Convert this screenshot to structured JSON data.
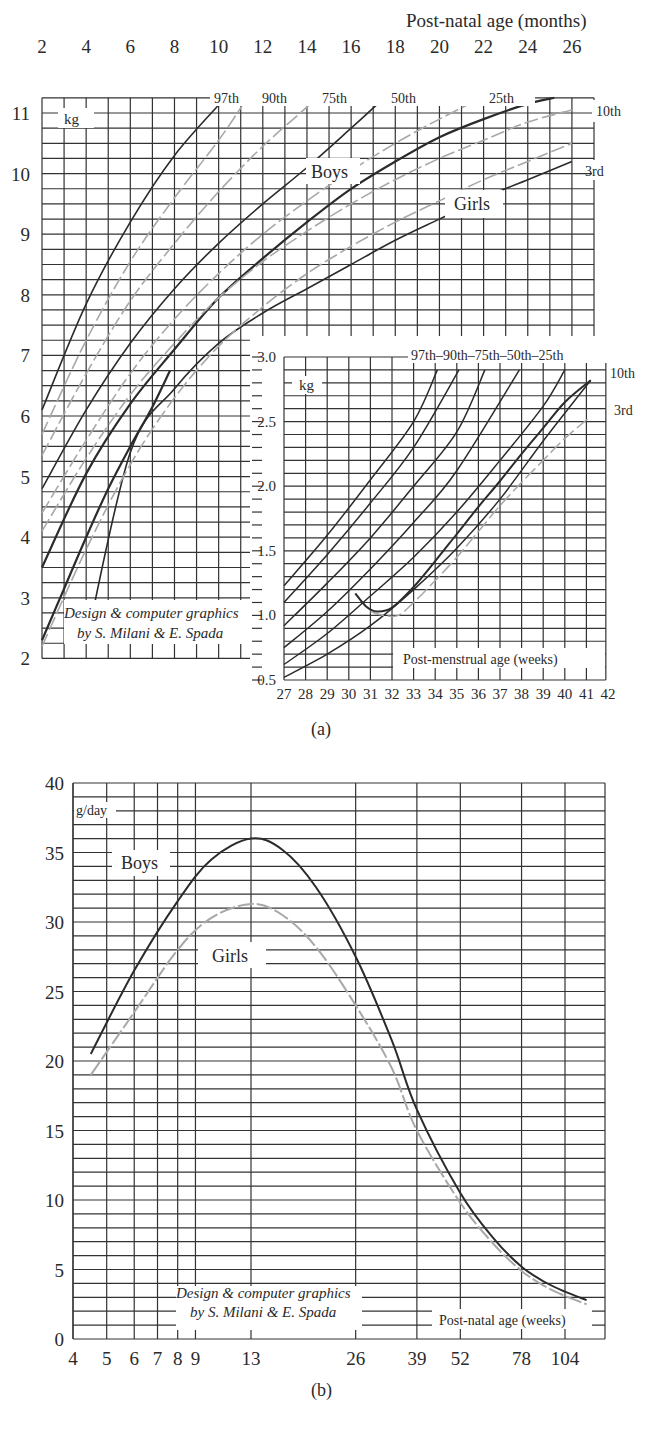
{
  "figure": {
    "panel_a_label": "(a)",
    "panel_b_label": "(b)"
  },
  "chart_data": [
    {
      "id": "a-main",
      "type": "line",
      "title": "",
      "xlabel": "Post-natal age (months)",
      "ylabel": "kg",
      "x_ticks": [
        2,
        4,
        6,
        8,
        10,
        12,
        14,
        16,
        18,
        20,
        22,
        24,
        26
      ],
      "y_ticks": [
        2,
        3,
        4,
        5,
        6,
        7,
        8,
        9,
        10,
        11
      ],
      "xlim": [
        2,
        27
      ],
      "ylim": [
        2,
        11.25
      ],
      "group_labels": [
        "Boys",
        "Girls"
      ],
      "legend_note": "Boys: solid dark lines; Girls: dashed grey lines",
      "series": [
        {
          "name": "Boys 97th",
          "group": "Boys",
          "x": [
            2,
            4,
            6,
            8,
            10.3
          ],
          "values": [
            6.1,
            7.85,
            9.2,
            10.3,
            11.25
          ]
        },
        {
          "name": "Boys 50th",
          "group": "Boys",
          "x": [
            2,
            4,
            6,
            8,
            10,
            12,
            14,
            16,
            17.5
          ],
          "values": [
            4.8,
            6.1,
            7.2,
            8.1,
            8.85,
            9.5,
            10.1,
            10.75,
            11.25
          ]
        },
        {
          "name": "Boys 10th",
          "group": "Boys",
          "x": [
            2,
            4,
            6,
            8,
            10,
            12,
            14,
            16,
            18,
            20,
            22,
            24,
            25.2
          ],
          "values": [
            3.5,
            5.05,
            6.2,
            7.1,
            7.95,
            8.6,
            9.2,
            9.75,
            10.2,
            10.6,
            10.9,
            11.15,
            11.25
          ]
        },
        {
          "name": "Boys 3rd",
          "group": "Boys",
          "x": [
            4,
            6,
            8,
            10,
            12,
            14,
            16,
            18,
            20,
            22,
            24,
            26
          ],
          "values": [
            2.25,
            5.4,
            6.45,
            7.2,
            7.7,
            8.1,
            8.5,
            8.9,
            9.25,
            9.6,
            9.9,
            10.2
          ]
        },
        {
          "name": "Boys 3rd (early)",
          "group": "Boys",
          "x": [
            2,
            3,
            4,
            5,
            6,
            7,
            7.8
          ],
          "values": [
            2.3,
            3.15,
            4.0,
            4.8,
            5.5,
            6.15,
            6.75
          ]
        },
        {
          "name": "Girls 90th",
          "group": "Girls",
          "x": [
            2,
            4,
            6,
            8,
            10,
            11.3
          ],
          "values": [
            5.7,
            7.25,
            8.55,
            9.6,
            10.55,
            11.25
          ]
        },
        {
          "name": "Girls 75th",
          "group": "Girls",
          "x": [
            2,
            4,
            6,
            8,
            10,
            12,
            14,
            14.3
          ],
          "values": [
            5.35,
            6.7,
            7.9,
            8.85,
            9.7,
            10.45,
            11.1,
            11.25
          ]
        },
        {
          "name": "Girls 25th",
          "group": "Girls",
          "x": [
            2,
            4,
            6,
            8,
            10,
            12,
            14,
            16,
            18,
            20,
            21.9
          ],
          "values": [
            4.4,
            5.6,
            6.7,
            7.6,
            8.35,
            9.0,
            9.55,
            10.05,
            10.5,
            10.9,
            11.25
          ]
        },
        {
          "name": "Girls 10th",
          "group": "Girls",
          "x": [
            2,
            4,
            6,
            8,
            10,
            12,
            14,
            16,
            18,
            20,
            22,
            24,
            26
          ],
          "values": [
            4.1,
            5.3,
            6.35,
            7.2,
            7.95,
            8.55,
            9.05,
            9.5,
            9.9,
            10.25,
            10.55,
            10.85,
            11.05
          ]
        },
        {
          "name": "Girls 3rd",
          "group": "Girls",
          "x": [
            2,
            4,
            6,
            8,
            10,
            12,
            14,
            16,
            18,
            20,
            22,
            24,
            26
          ],
          "values": [
            2.2,
            3.8,
            5.2,
            6.3,
            7.15,
            7.8,
            8.35,
            8.8,
            9.2,
            9.55,
            9.9,
            10.2,
            10.5
          ]
        }
      ],
      "percentile_labels": [
        "97th",
        "90th",
        "75th",
        "50th",
        "25th",
        "10th",
        "3rd"
      ],
      "annotations": [
        "Design & computer graphics",
        "by S. Milani & E. Spada"
      ]
    },
    {
      "id": "a-inset",
      "type": "line",
      "title": "",
      "xlabel": "Post-menstrual age (weeks)",
      "ylabel": "kg",
      "x_ticks": [
        27,
        28,
        29,
        30,
        31,
        32,
        33,
        34,
        35,
        36,
        37,
        38,
        39,
        40,
        41,
        42
      ],
      "y_ticks": [
        0.5,
        1.0,
        1.5,
        2.0,
        2.5,
        3.0
      ],
      "xlim": [
        27,
        42
      ],
      "ylim": [
        0.5,
        3.0
      ],
      "percentile_labels": [
        "97th",
        "90th",
        "75th",
        "50th",
        "25th",
        "10th",
        "3rd"
      ],
      "series": [
        {
          "name": "97th",
          "x": [
            27,
            29,
            31,
            33,
            34.1
          ],
          "values": [
            1.23,
            1.62,
            2.05,
            2.5,
            2.9
          ]
        },
        {
          "name": "90th",
          "x": [
            27,
            29,
            31,
            33,
            35.1
          ],
          "values": [
            1.1,
            1.47,
            1.87,
            2.3,
            2.9
          ]
        },
        {
          "name": "75th",
          "x": [
            27,
            29,
            31,
            33,
            35,
            36.3
          ],
          "values": [
            0.92,
            1.25,
            1.6,
            2.0,
            2.42,
            2.9
          ]
        },
        {
          "name": "50th",
          "x": [
            27,
            29,
            31,
            33,
            35,
            37.9
          ],
          "values": [
            0.75,
            1.03,
            1.36,
            1.72,
            2.12,
            2.9
          ]
        },
        {
          "name": "25th",
          "x": [
            27,
            29,
            31,
            33,
            35,
            37,
            39,
            40.0
          ],
          "values": [
            0.62,
            0.86,
            1.15,
            1.45,
            1.8,
            2.2,
            2.62,
            2.9
          ]
        },
        {
          "name": "10th",
          "x": [
            27,
            29,
            31,
            33,
            35,
            37,
            39,
            41.2
          ],
          "values": [
            0.52,
            0.7,
            0.92,
            1.2,
            1.52,
            1.9,
            2.35,
            2.82
          ]
        },
        {
          "name": "Boys post-natal",
          "x": [
            30.3,
            30.8,
            31.3,
            32,
            33,
            34,
            35,
            36,
            37,
            38,
            39,
            40,
            41.2
          ],
          "values": [
            1.17,
            1.07,
            1.03,
            1.06,
            1.22,
            1.42,
            1.63,
            1.84,
            2.04,
            2.25,
            2.45,
            2.65,
            2.82
          ]
        },
        {
          "name": "Girls post-natal 3rd",
          "x": [
            31,
            31.6,
            32.3,
            33,
            34,
            35,
            36,
            37,
            38,
            39,
            40,
            41.2
          ],
          "values": [
            1.03,
            1.0,
            1.0,
            1.1,
            1.27,
            1.45,
            1.65,
            1.85,
            2.03,
            2.2,
            2.37,
            2.54
          ]
        }
      ]
    },
    {
      "id": "b",
      "type": "line",
      "title": "",
      "xlabel": "Post-natal age (weeks)",
      "ylabel": "g/day",
      "x_scale": "log",
      "x_ticks": [
        4,
        5,
        6,
        7,
        8,
        9,
        13,
        26,
        39,
        52,
        78,
        104
      ],
      "y_ticks": [
        0,
        5,
        10,
        15,
        20,
        25,
        30,
        35,
        40
      ],
      "xlim": [
        4,
        130
      ],
      "ylim": [
        0,
        40
      ],
      "series": [
        {
          "name": "Boys",
          "x": [
            4.5,
            6,
            8,
            10,
            13,
            16,
            20,
            26,
            33,
            39,
            52,
            65,
            78,
            91,
            104,
            120
          ],
          "values": [
            20.5,
            26.5,
            31.5,
            34.5,
            36,
            35.2,
            32.5,
            27.5,
            21.5,
            16.5,
            10.5,
            7.2,
            5.2,
            4.1,
            3.4,
            2.8
          ]
        },
        {
          "name": "Girls",
          "x": [
            4.5,
            6,
            8,
            10,
            13,
            16,
            20,
            26,
            33,
            39,
            52,
            65,
            78,
            91,
            104,
            120
          ],
          "values": [
            19,
            23.5,
            28,
            30.3,
            31.3,
            30.5,
            28.2,
            24,
            19.5,
            15,
            9.8,
            6.8,
            4.9,
            3.8,
            3.1,
            2.5
          ]
        }
      ],
      "group_labels": [
        "Boys",
        "Girls"
      ],
      "annotations": [
        "Design & computer graphics",
        "by S. Milani & E. Spada"
      ]
    }
  ],
  "labels": {
    "a_main": {
      "xlabel": "Post-natal age (months)",
      "unit": "kg",
      "boys": "Boys",
      "girls": "Girls",
      "credit1": "Design & computer graphics",
      "credit2": "by S. Milani & E. Spada"
    },
    "a_inset": {
      "xlabel": "Post-menstrual age (weeks)",
      "unit": "kg",
      "pct_row": "97th–90th–75th–50th–25th",
      "p10": "10th",
      "p3": "3rd"
    },
    "b": {
      "xlabel": "Post-natal age (weeks)",
      "unit": "g/day",
      "boys": "Boys",
      "girls": "Girls",
      "credit1": "Design & computer graphics",
      "credit2": "by S. Milani & E. Spada"
    },
    "a_main_pct": {
      "p97": "97th",
      "p90": "90th",
      "p75": "75th",
      "p50": "50th",
      "p25": "25th",
      "p10": "10th",
      "p3": "3rd"
    }
  },
  "colors": {
    "boys": "#2b2b2b",
    "girls": "#a8a8a8",
    "grid": "#3a3a3a",
    "text": "#2a2a2a"
  }
}
